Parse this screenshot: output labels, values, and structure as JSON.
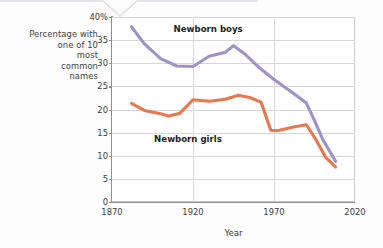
{
  "chart_data": {
    "type": "line",
    "title": "",
    "xlabel": "Year",
    "ylabel": "Percentage with one of 10 most common names",
    "ylabel_lines": [
      "Percentage with",
      "one of 10",
      "most",
      "common",
      "names"
    ],
    "xlim": [
      1870,
      2020
    ],
    "ylim": [
      0,
      40
    ],
    "xticks": [
      1870,
      1920,
      1970,
      2020
    ],
    "xtick_labels": [
      "1870",
      "1920",
      "1970",
      "2020"
    ],
    "yticks": [
      0,
      5,
      10,
      15,
      20,
      25,
      30,
      35,
      40
    ],
    "ytick_labels": [
      "0",
      "5",
      "10",
      "15",
      "20",
      "25",
      "30",
      "35",
      "40%"
    ],
    "grid": "both",
    "legend_position": "inline-annotations",
    "series": [
      {
        "name": "Newborn boys",
        "color": "#9f92c9",
        "label_x": 1908,
        "label_y": 37.4,
        "x": [
          1882,
          1890,
          1900,
          1910,
          1920,
          1930,
          1940,
          1945,
          1952,
          1960,
          1970,
          1980,
          1990,
          1995,
          2000,
          2008
        ],
        "values": [
          37.9,
          34.2,
          31.0,
          29.4,
          29.3,
          31.5,
          32.4,
          33.8,
          32.0,
          29.3,
          26.5,
          24.0,
          21.4,
          17.6,
          13.6,
          8.8
        ]
      },
      {
        "name": "Newborn girls",
        "color": "#e8764f",
        "label_x": 1896,
        "label_y": 13.6,
        "x": [
          1882,
          1890,
          1900,
          1905,
          1912,
          1920,
          1930,
          1940,
          1948,
          1955,
          1962,
          1968,
          1972,
          1982,
          1990,
          1996,
          2002,
          2008
        ],
        "values": [
          21.3,
          19.8,
          19.1,
          18.6,
          19.2,
          22.1,
          21.8,
          22.2,
          23.1,
          22.6,
          21.6,
          15.5,
          15.4,
          16.2,
          16.7,
          13.4,
          9.6,
          7.6
        ]
      }
    ]
  },
  "axes": {
    "x_title": "Year",
    "y_title_lines": [
      "Percentage with",
      "one of 10",
      "most",
      "common",
      "names"
    ]
  }
}
